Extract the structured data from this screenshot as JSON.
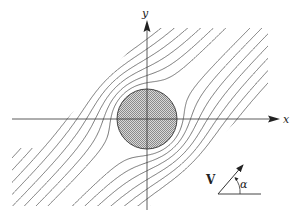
{
  "diagram": {
    "title": "",
    "axes": {
      "x_label": "x",
      "y_label": "y",
      "origin": [
        147,
        119
      ],
      "x_axis": {
        "from": 12,
        "to": 280
      },
      "y_axis": {
        "from": 210,
        "to": 20
      }
    },
    "cylinder": {
      "center": [
        147,
        119
      ],
      "radius": 30,
      "fill": "#b0b0b0",
      "stroke": "#444444"
    },
    "flow": {
      "angle_deg": 45,
      "streamline_count": 27,
      "streamline_spacing": 8.2,
      "line_color": "#555555",
      "clip_polygon": [
        [
          40,
          148
        ],
        [
          150,
          28
        ],
        [
          268,
          28
        ],
        [
          268,
          90
        ],
        [
          150,
          206
        ],
        [
          40,
          206
        ],
        [
          12,
          206
        ],
        [
          12,
          148
        ]
      ]
    },
    "velocity_indicator": {
      "vector_label": "V",
      "angle_label": "α",
      "base": [
        218,
        194
      ],
      "baseline_end": [
        261,
        194
      ],
      "tip": [
        243,
        165
      ]
    },
    "colors": {
      "axis": "#333333",
      "text": "#222222",
      "background": "#ffffff"
    }
  }
}
